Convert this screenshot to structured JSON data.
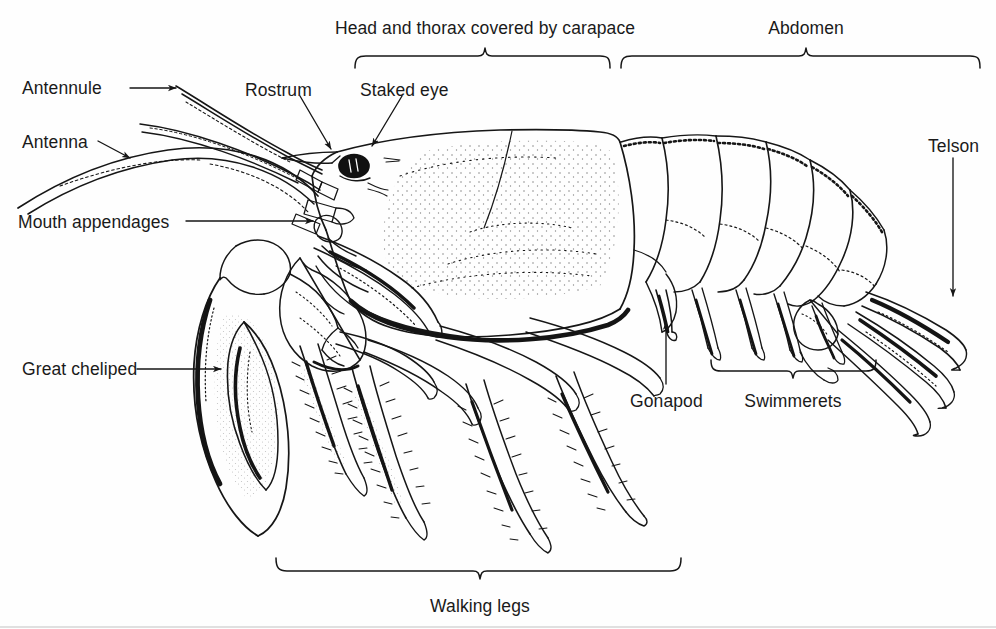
{
  "figure": {
    "ink_color": "#161616",
    "paper_color": "#fefefe"
  },
  "labels": {
    "antennule": {
      "text": "Antennule",
      "x": 22,
      "y": 80,
      "align": "left"
    },
    "antenna": {
      "text": "Antenna",
      "x": 22,
      "y": 134,
      "align": "left"
    },
    "mouth": {
      "text": "Mouth appendages",
      "x": 18,
      "y": 214,
      "align": "left"
    },
    "cheliped": {
      "text": "Great cheliped",
      "x": 22,
      "y": 361,
      "align": "left"
    },
    "rostrum": {
      "text": "Rostrum",
      "x": 245,
      "y": 82,
      "align": "left"
    },
    "stakedeye": {
      "text": "Staked eye",
      "x": 360,
      "y": 82,
      "align": "left"
    },
    "carapace": {
      "text": "Head and thorax covered by carapace",
      "x": 485,
      "y": 20,
      "align": "center"
    },
    "abdomen": {
      "text": "Abdomen",
      "x": 806,
      "y": 20,
      "align": "center"
    },
    "telson": {
      "text": "Telson",
      "x": 928,
      "y": 138,
      "align": "left"
    },
    "gonapod": {
      "text": "Gonapod",
      "x": 630,
      "y": 393,
      "align": "left"
    },
    "swimmerets": {
      "text": "Swimmerets",
      "x": 793,
      "y": 393,
      "align": "center"
    },
    "walkinglegs": {
      "text": "Walking legs",
      "x": 480,
      "y": 598,
      "align": "center"
    }
  },
  "brackets": {
    "carapace": {
      "x1": 355,
      "x2": 610,
      "y": 56,
      "tick": 485,
      "direction": "down"
    },
    "abdomen": {
      "x1": 621,
      "x2": 980,
      "y": 56,
      "tick": 806,
      "direction": "down"
    },
    "swimmerets": {
      "x1": 711,
      "x2": 876,
      "y": 371,
      "tick": 793,
      "direction": "up"
    },
    "walking_legs": {
      "x1": 276,
      "x2": 681,
      "y": 571,
      "tick": 480,
      "direction": "up"
    }
  },
  "leaders": {
    "antennule": {
      "from": [
        130,
        88
      ],
      "to": [
        176,
        88
      ]
    },
    "antenna": {
      "from": [
        98,
        141
      ],
      "to": [
        130,
        158
      ]
    },
    "mouth": {
      "from": [
        186,
        221
      ],
      "to": [
        313,
        221
      ]
    },
    "cheliped": {
      "from": [
        137,
        369
      ],
      "to": [
        221,
        369
      ]
    },
    "rostrum": {
      "from": [
        300,
        96
      ],
      "to": [
        330,
        148
      ]
    },
    "stakedeye": {
      "from": [
        402,
        96
      ],
      "to": [
        372,
        146
      ]
    },
    "telson": {
      "from": [
        953,
        158
      ],
      "to": [
        953,
        296
      ]
    },
    "gonapod": {
      "from": [
        666,
        384
      ],
      "to": [
        666,
        322
      ]
    }
  },
  "anatomy_parts": [
    "antennule",
    "antenna",
    "rostrum",
    "staked eye",
    "mouth appendages",
    "great cheliped",
    "walking legs",
    "gonapod",
    "swimmerets",
    "head and thorax covered by carapace",
    "abdomen",
    "telson"
  ],
  "abdomen_segments": 6
}
